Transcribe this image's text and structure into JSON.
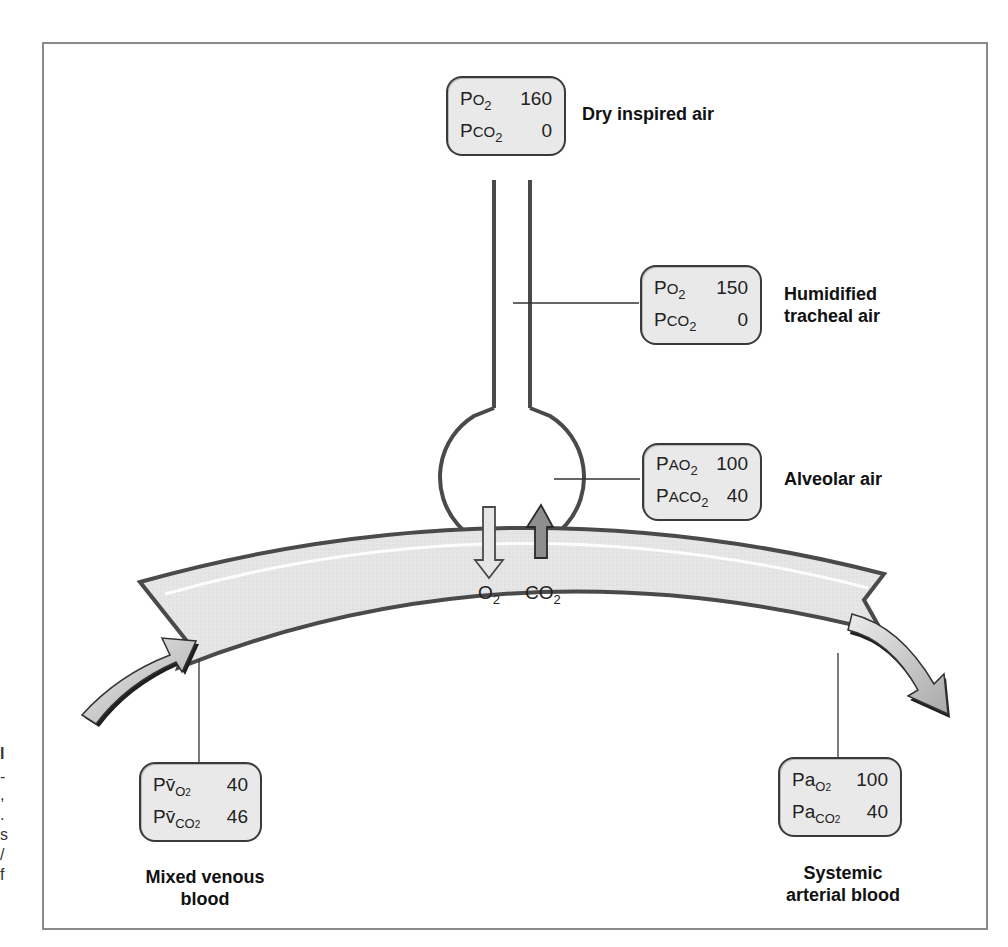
{
  "diagram": {
    "stages": {
      "dry_inspired_air": {
        "caption": "Dry inspired air",
        "rows": [
          {
            "prefix": "P",
            "small": "O",
            "sub": "2",
            "value": "160"
          },
          {
            "prefix": "P",
            "small": "CO",
            "sub": "2",
            "value": "0"
          }
        ]
      },
      "humidified_tracheal_air": {
        "caption_line1": "Humidified",
        "caption_line2": "tracheal air",
        "rows": [
          {
            "prefix": "P",
            "small": "O",
            "sub": "2",
            "value": "150"
          },
          {
            "prefix": "P",
            "small": "CO",
            "sub": "2",
            "value": "0"
          }
        ]
      },
      "alveolar_air": {
        "caption": "Alveolar air",
        "rows": [
          {
            "prefix": "P",
            "small": "AO",
            "sub": "2",
            "value": "100"
          },
          {
            "prefix": "P",
            "small": "ACO",
            "sub": "2",
            "value": "40"
          }
        ]
      },
      "mixed_venous_blood": {
        "caption_line1": "Mixed venous",
        "caption_line2": "blood",
        "rows": [
          {
            "prefix": "P",
            "small": "v̄",
            "subtext": "O",
            "sub": "2",
            "value": "40"
          },
          {
            "prefix": "P",
            "small": "v̄",
            "subtext": "CO",
            "sub": "2",
            "value": "46"
          }
        ]
      },
      "systemic_arterial_blood": {
        "caption_line1": "Systemic",
        "caption_line2": "arterial blood",
        "rows": [
          {
            "prefix": "Pa",
            "subtext": "O",
            "sub": "2",
            "value": "100"
          },
          {
            "prefix": "Pa",
            "subtext": "CO",
            "sub": "2",
            "value": "40"
          }
        ]
      }
    },
    "exchange": {
      "o2_label": "O",
      "o2_sub": "2",
      "co2_label": "CO",
      "co2_sub": "2"
    },
    "edge_fragments": [
      "l",
      "-",
      ",",
      ".",
      "s",
      "/",
      "f"
    ],
    "colors": {
      "outline": "#3a3a3a",
      "box_fill": "#e9e9e9",
      "vessel_fill": "#e4e4e4",
      "o2_arrow": "#e6e6e6",
      "co2_arrow": "#8e8e8e",
      "flow_arrow": "#c8c8c8"
    }
  }
}
